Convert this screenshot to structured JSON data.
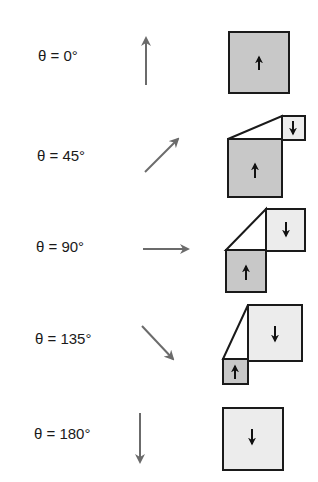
{
  "diagram": {
    "rows": [
      {
        "label": "θ = 0°",
        "angle_deg": 0
      },
      {
        "label": "θ = 45°",
        "angle_deg": 45
      },
      {
        "label": "θ = 90°",
        "angle_deg": 90
      },
      {
        "label": "θ = 135°",
        "angle_deg": 135
      },
      {
        "label": "θ = 180°",
        "angle_deg": 180
      }
    ],
    "colors": {
      "arrow": "#6b6b6b",
      "outline": "#1a1a1a",
      "up_domain_fill": "#c8c8c8",
      "down_domain_fill": "#ececec"
    }
  }
}
